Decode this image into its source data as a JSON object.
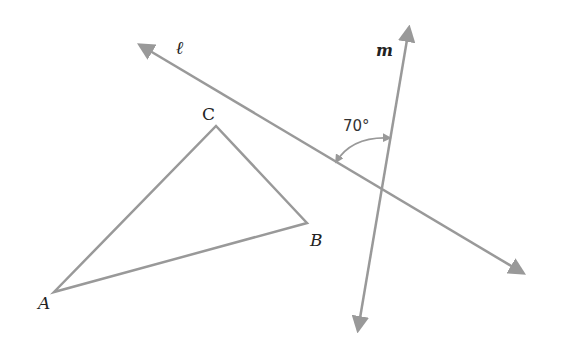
{
  "diagram": {
    "colors": {
      "line": "#999999",
      "text": "#222222",
      "background": "#ffffff"
    },
    "triangle": {
      "vertices": {
        "A": {
          "label": "A",
          "x": 54,
          "y": 292
        },
        "B": {
          "label": "B",
          "x": 307,
          "y": 223
        },
        "C": {
          "label": "C",
          "x": 216,
          "y": 126
        }
      }
    },
    "lines": {
      "l": {
        "label": "ℓ",
        "from": [
          140,
          45
        ],
        "to": [
          523,
          273
        ]
      },
      "m": {
        "label": "m",
        "from": [
          358,
          330
        ],
        "to": [
          409,
          28
        ]
      }
    },
    "angle": {
      "label": "70°",
      "value": 70,
      "between": [
        "ℓ",
        "m"
      ]
    }
  }
}
